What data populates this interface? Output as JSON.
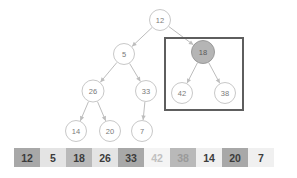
{
  "figure": {
    "type": "binary-tree-with-array"
  },
  "tree": {
    "nodes": [
      {
        "id": "n12",
        "label": "12",
        "cx": 160,
        "cy": 20,
        "r": 10.5,
        "filled": false
      },
      {
        "id": "n5",
        "label": "5",
        "cx": 124,
        "cy": 54,
        "r": 10.5,
        "filled": false
      },
      {
        "id": "n18",
        "label": "18",
        "cx": 203,
        "cy": 52,
        "r": 11.5,
        "filled": true
      },
      {
        "id": "n26",
        "label": "26",
        "cx": 93,
        "cy": 91,
        "r": 11,
        "filled": false
      },
      {
        "id": "n33",
        "label": "33",
        "cx": 146,
        "cy": 91,
        "r": 10.5,
        "filled": false
      },
      {
        "id": "n42",
        "label": "42",
        "cx": 182,
        "cy": 93,
        "r": 10.5,
        "filled": false
      },
      {
        "id": "n38",
        "label": "38",
        "cx": 225,
        "cy": 93,
        "r": 10.5,
        "filled": false
      },
      {
        "id": "n14",
        "label": "14",
        "cx": 76,
        "cy": 131,
        "r": 10.5,
        "filled": false
      },
      {
        "id": "n20",
        "label": "20",
        "cx": 110,
        "cy": 131,
        "r": 10.5,
        "filled": false
      },
      {
        "id": "n7",
        "label": "7",
        "cx": 142,
        "cy": 131,
        "r": 10.5,
        "filled": false
      }
    ],
    "edges": [
      {
        "from": "n12",
        "to": "n5"
      },
      {
        "from": "n12",
        "to": "n18"
      },
      {
        "from": "n5",
        "to": "n26"
      },
      {
        "from": "n5",
        "to": "n33"
      },
      {
        "from": "n26",
        "to": "n14"
      },
      {
        "from": "n26",
        "to": "n20"
      },
      {
        "from": "n33",
        "to": "n7"
      },
      {
        "from": "n18",
        "to": "n42"
      },
      {
        "from": "n18",
        "to": "n38"
      }
    ],
    "highlight_box": {
      "x": 165,
      "y": 38,
      "width": 78,
      "height": 72,
      "color": "#5e5e5e"
    },
    "colors": {
      "node_stroke": "#c8c8c8",
      "node_fill": "#ffffff",
      "node_fill_highlight": "#b5b5b5",
      "label": "#7a7a7a",
      "edge": "#bdbdbd"
    }
  },
  "array": {
    "cells": [
      {
        "value": "12",
        "bg": "#a8a8a8",
        "fg": "#3c3c3c"
      },
      {
        "value": "5",
        "bg": "#e4e4e4",
        "fg": "#3c3c3c"
      },
      {
        "value": "18",
        "bg": "#b9b9b9",
        "fg": "#3c3c3c"
      },
      {
        "value": "26",
        "bg": "#e4e4e4",
        "fg": "#3c3c3c"
      },
      {
        "value": "33",
        "bg": "#a8a8a8",
        "fg": "#3c3c3c"
      },
      {
        "value": "42",
        "bg": "#f4f4f4",
        "fg": "#c0c0c0"
      },
      {
        "value": "38",
        "bg": "#b9b9b9",
        "fg": "#9a9a9a"
      },
      {
        "value": "14",
        "bg": "#f0f0f0",
        "fg": "#3c3c3c"
      },
      {
        "value": "20",
        "bg": "#a8a8a8",
        "fg": "#3c3c3c"
      },
      {
        "value": "7",
        "bg": "#f0f0f0",
        "fg": "#3c3c3c"
      }
    ]
  }
}
